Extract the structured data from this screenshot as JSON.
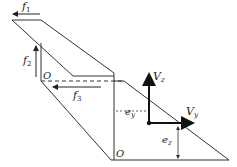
{
  "diagram": {
    "labels": {
      "f1": "f",
      "f1_sub": "1",
      "f2": "f",
      "f2_sub": "2",
      "f3": "f",
      "f3_sub": "3",
      "origin_upper": "O",
      "origin_lower": "O",
      "Vz": "V",
      "Vz_sub": "z",
      "Vy": "V",
      "Vy_sub": "y",
      "ey": "e",
      "ey_sub": "y",
      "ez": "e",
      "ez_sub": "z"
    },
    "colors": {
      "line": "#222222",
      "background": "#ffffff"
    }
  }
}
